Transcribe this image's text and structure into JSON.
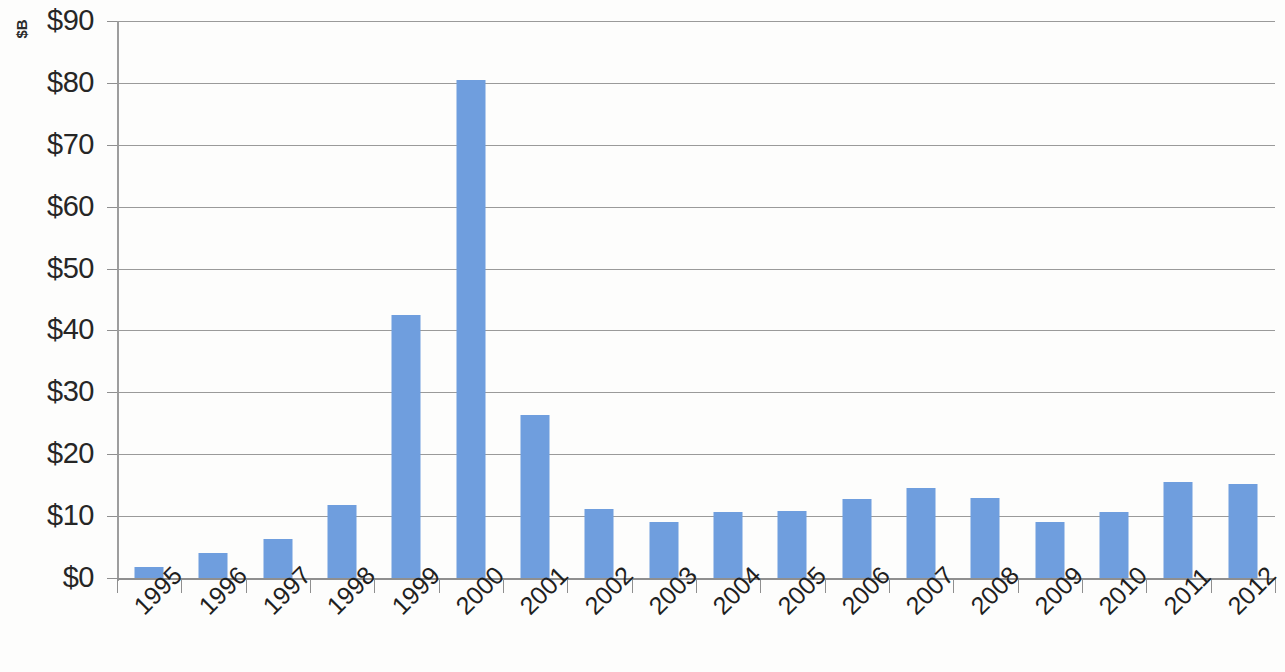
{
  "chart_data": {
    "type": "bar",
    "title": "",
    "subtitle": "",
    "xlabel": "",
    "ylabel": "$B",
    "categories": [
      "1995",
      "1996",
      "1997",
      "1998",
      "1999",
      "2000",
      "2001",
      "2002",
      "2003",
      "2004",
      "2005",
      "2006",
      "2007",
      "2008",
      "2009",
      "2010",
      "2011",
      "2012"
    ],
    "values": [
      1.8,
      4.1,
      6.3,
      11.8,
      42.5,
      80.5,
      26.4,
      11.2,
      9.1,
      10.6,
      10.9,
      12.7,
      14.5,
      12.9,
      9.0,
      10.6,
      15.5,
      15.2
    ],
    "ylim": [
      0,
      90
    ],
    "ytick_values": [
      0,
      10,
      20,
      30,
      40,
      50,
      60,
      70,
      80,
      90
    ],
    "ytick_labels": [
      "$0",
      "$10",
      "$20",
      "$30",
      "$40",
      "$50",
      "$60",
      "$70",
      "$80",
      "$90"
    ],
    "grid": true,
    "grid_axis": "y",
    "legend": null,
    "legend_position": "none",
    "bar_color": "#6F9EDE",
    "gridline_color": "#9A9A9A",
    "axis_color": "#8F8F8F",
    "text_color": "#262626",
    "background_color": "#FDFDFC",
    "x_tick_rotation": -45,
    "bar_count": 18
  },
  "axis": {
    "y_title": "$B"
  }
}
